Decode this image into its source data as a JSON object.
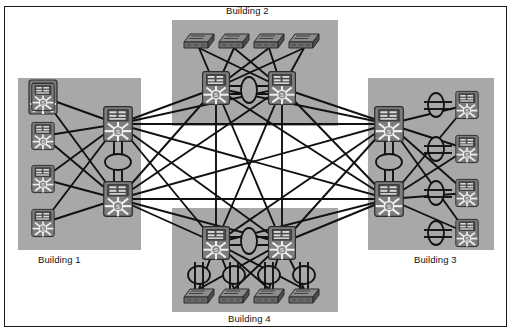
{
  "diagram": {
    "background_color": "#ffffff",
    "frame_color": "#1a1a1a",
    "zone_fill": "#a8a8a8",
    "device_body": "#7d7d7d",
    "device_dark": "#3c3c3c",
    "link_color": "#111111",
    "width": 512,
    "height": 334
  },
  "labels": {
    "building1": "Building 1",
    "building2": "Building 2",
    "building3": "Building 3",
    "building4": "Building 4"
  },
  "zones": [
    {
      "id": "b1",
      "label": "Building 1",
      "x": 18,
      "y": 78,
      "w": 123,
      "h": 172,
      "label_x": 38,
      "label_y": 254
    },
    {
      "id": "b2",
      "label": "Building 2",
      "x": 172,
      "y": 20,
      "w": 166,
      "h": 106,
      "label_x": 226,
      "label_y": 5
    },
    {
      "id": "b3",
      "label": "Building 3",
      "x": 368,
      "y": 78,
      "w": 126,
      "h": 172,
      "label_x": 414,
      "label_y": 254
    },
    {
      "id": "b4",
      "label": "Building 4",
      "x": 172,
      "y": 208,
      "w": 166,
      "h": 104,
      "label_x": 228,
      "label_y": 313
    }
  ],
  "devices": {
    "core": [
      {
        "id": "b1-core-a",
        "building": "Building 1",
        "type": "multilayer-switch",
        "x": 118,
        "y": 124,
        "size": 34
      },
      {
        "id": "b1-core-b",
        "building": "Building 1",
        "type": "multilayer-switch",
        "x": 118,
        "y": 199,
        "size": 34
      },
      {
        "id": "b2-core-a",
        "building": "Building 2",
        "type": "multilayer-switch",
        "x": 216,
        "y": 88,
        "size": 32
      },
      {
        "id": "b2-core-b",
        "building": "Building 2",
        "type": "multilayer-switch",
        "x": 282,
        "y": 88,
        "size": 32
      },
      {
        "id": "b3-core-a",
        "building": "Building 3",
        "type": "multilayer-switch",
        "x": 389,
        "y": 124,
        "size": 34
      },
      {
        "id": "b3-core-b",
        "building": "Building 3",
        "type": "multilayer-switch",
        "x": 389,
        "y": 199,
        "size": 34
      },
      {
        "id": "b4-core-a",
        "building": "Building 4",
        "type": "multilayer-switch",
        "x": 216,
        "y": 243,
        "size": 32
      },
      {
        "id": "b4-core-b",
        "building": "Building 4",
        "type": "multilayer-switch",
        "x": 282,
        "y": 243,
        "size": 32
      }
    ],
    "access_multilayer": [
      {
        "id": "b1-acc-1",
        "building": "Building 1",
        "type": "multilayer-switch",
        "x": 43,
        "y": 97,
        "size": 27
      },
      {
        "id": "b1-acc-2",
        "building": "Building 1",
        "type": "multilayer-switch",
        "x": 43,
        "y": 136,
        "size": 27
      },
      {
        "id": "b1-acc-3",
        "building": "Building 1",
        "type": "multilayer-switch",
        "x": 43,
        "y": 179,
        "size": 27
      },
      {
        "id": "b1-acc-4",
        "building": "Building 1",
        "type": "multilayer-switch",
        "x": 43,
        "y": 223,
        "size": 27
      },
      {
        "id": "b3-acc-1",
        "building": "Building 3",
        "type": "multilayer-switch",
        "x": 467,
        "y": 105,
        "size": 27
      },
      {
        "id": "b3-acc-2",
        "building": "Building 3",
        "type": "multilayer-switch",
        "x": 467,
        "y": 149,
        "size": 27
      },
      {
        "id": "b3-acc-3",
        "building": "Building 3",
        "type": "multilayer-switch",
        "x": 467,
        "y": 193,
        "size": 27
      },
      {
        "id": "b3-acc-4",
        "building": "Building 3",
        "type": "multilayer-switch",
        "x": 467,
        "y": 233,
        "size": 27
      }
    ],
    "workgroup_switches": [
      {
        "id": "b2-sw-1",
        "building": "Building 2",
        "type": "workgroup-switch",
        "x": 199,
        "y": 40
      },
      {
        "id": "b2-sw-2",
        "building": "Building 2",
        "type": "workgroup-switch",
        "x": 234,
        "y": 40
      },
      {
        "id": "b2-sw-3",
        "building": "Building 2",
        "type": "workgroup-switch",
        "x": 269,
        "y": 40
      },
      {
        "id": "b2-sw-4",
        "building": "Building 2",
        "type": "workgroup-switch",
        "x": 304,
        "y": 40
      },
      {
        "id": "b4-sw-1",
        "building": "Building 4",
        "type": "workgroup-switch",
        "x": 199,
        "y": 295
      },
      {
        "id": "b4-sw-2",
        "building": "Building 4",
        "type": "workgroup-switch",
        "x": 234,
        "y": 295
      },
      {
        "id": "b4-sw-3",
        "building": "Building 4",
        "type": "workgroup-switch",
        "x": 269,
        "y": 295
      },
      {
        "id": "b4-sw-4",
        "building": "Building 4",
        "type": "workgroup-switch",
        "x": 304,
        "y": 295
      }
    ],
    "ring_symbols": [
      {
        "id": "b1-ring",
        "building": "Building 1",
        "type": "ring-ellipse",
        "cx": 118,
        "cy": 162,
        "rx": 11,
        "ry": 7
      },
      {
        "id": "b2-ring",
        "building": "Building 2",
        "type": "ring-ellipse",
        "cx": 249,
        "cy": 90,
        "rx": 7,
        "ry": 11
      },
      {
        "id": "b3-ring",
        "building": "Building 3",
        "type": "ring-ellipse",
        "cx": 389,
        "cy": 162,
        "rx": 11,
        "ry": 7
      },
      {
        "id": "b4-ring",
        "building": "Building 4",
        "type": "ring-ellipse",
        "cx": 249,
        "cy": 241,
        "rx": 7,
        "ry": 11
      },
      {
        "id": "b3-ring-1",
        "building": "Building 3",
        "type": "ring-ellipse",
        "cx": 436,
        "cy": 105,
        "rx": 7,
        "ry": 11
      },
      {
        "id": "b3-ring-2",
        "building": "Building 3",
        "type": "ring-ellipse",
        "cx": 436,
        "cy": 149,
        "rx": 7,
        "ry": 11
      },
      {
        "id": "b3-ring-3",
        "building": "Building 3",
        "type": "ring-ellipse",
        "cx": 436,
        "cy": 193,
        "rx": 7,
        "ry": 11
      },
      {
        "id": "b3-ring-4",
        "building": "Building 3",
        "type": "ring-ellipse",
        "cx": 436,
        "cy": 233,
        "rx": 7,
        "ry": 11
      },
      {
        "id": "b4-ring-1",
        "building": "Building 4",
        "type": "ring-ellipse",
        "cx": 199,
        "cy": 275,
        "rx": 10,
        "ry": 8
      },
      {
        "id": "b4-ring-2",
        "building": "Building 4",
        "type": "ring-ellipse",
        "cx": 234,
        "cy": 275,
        "rx": 10,
        "ry": 8
      },
      {
        "id": "b4-ring-3",
        "building": "Building 4",
        "type": "ring-ellipse",
        "cx": 269,
        "cy": 275,
        "rx": 10,
        "ry": 8
      },
      {
        "id": "b4-ring-4",
        "building": "Building 4",
        "type": "ring-ellipse",
        "cx": 304,
        "cy": 275,
        "rx": 10,
        "ry": 8
      }
    ]
  },
  "links": {
    "note": "Core switches form a full mesh across all four buildings",
    "mesh_nodes": [
      "b1-core-a",
      "b1-core-b",
      "b2-core-a",
      "b2-core-b",
      "b3-core-a",
      "b3-core-b",
      "b4-core-a",
      "b4-core-b"
    ]
  }
}
